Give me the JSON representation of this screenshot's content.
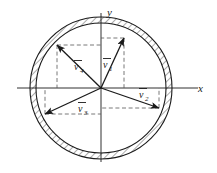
{
  "figure": {
    "background_color": "#ffffff",
    "line_color": "#1a1a1a",
    "hatch_color": "#555555",
    "dash_color": "#666666"
  },
  "axes": {
    "x_label": "x",
    "y_label": "y",
    "origin": {
      "x": 101,
      "y": 88
    },
    "x_range_px": [
      17,
      198
    ],
    "y_range_px": [
      13,
      162
    ]
  },
  "annulus": {
    "outer_radius": 71,
    "inner_radius": 65,
    "hatched": true,
    "hatch_angle_deg": 45
  },
  "vectors": [
    {
      "name": "v1",
      "label": "v",
      "subscript": "1",
      "overbar": true,
      "angle_deg": 68,
      "magnitude_px": 62,
      "tip": {
        "x": 124,
        "y": 38
      },
      "label_pos": {
        "x": 104,
        "y": 66
      },
      "projection_x": true,
      "projection_y": true
    },
    {
      "name": "v2",
      "label": "v",
      "subscript": "2",
      "overbar": true,
      "angle_deg": -20,
      "magnitude_px": 62,
      "tip": {
        "x": 159,
        "y": 108
      },
      "label_pos": {
        "x": 140,
        "y": 96
      },
      "projection_x": true,
      "projection_y": true
    },
    {
      "name": "v3",
      "label": "v",
      "subscript": "3",
      "overbar": true,
      "angle_deg": 205,
      "magnitude_px": 62,
      "tip": {
        "x": 45,
        "y": 114
      },
      "label_pos": {
        "x": 80,
        "y": 110
      },
      "projection_x": true,
      "projection_y": true
    },
    {
      "name": "v4",
      "label": "v",
      "subscript": "4",
      "overbar": true,
      "angle_deg": 136,
      "magnitude_px": 62,
      "tip": {
        "x": 57,
        "y": 45
      },
      "label_pos": {
        "x": 76,
        "y": 68
      },
      "projection_x": true,
      "projection_y": true
    }
  ]
}
